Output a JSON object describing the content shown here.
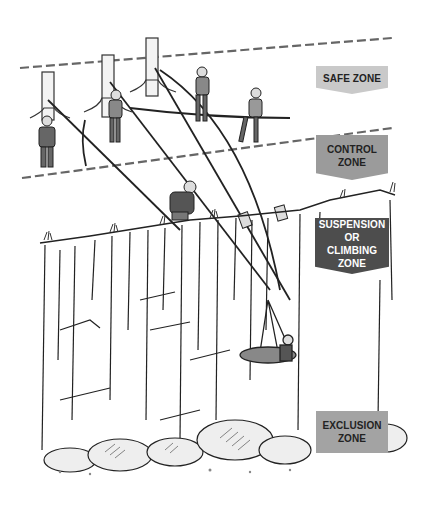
{
  "figure": {
    "style": "black-and-white line illustration"
  },
  "zones": [
    {
      "id": "safe",
      "label": "SAFE ZONE",
      "color": "#c9c9c9",
      "text_color": "#222222"
    },
    {
      "id": "control",
      "label": "CONTROL ZONE",
      "color": "#9b9b9b",
      "text_color": "#222222"
    },
    {
      "id": "suspension",
      "label": "SUSPENSION OR CLIMBING ZONE",
      "color": "#4d4d4d",
      "text_color": "#ffffff"
    },
    {
      "id": "exclusion",
      "label": "EXCLUSION ZONE",
      "color": "#a3a3a3",
      "text_color": "#222222"
    }
  ],
  "scene_elements": {
    "trees": 3,
    "rescuers_on_top": 4,
    "rescuer_at_edge": 1,
    "stretcher_with_attendant": 1,
    "zone_boundaries": "dashed lines"
  }
}
